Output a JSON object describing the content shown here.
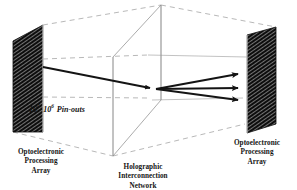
{
  "figure": {
    "background_color": "#ffffff",
    "ink_color": "#141414",
    "wireframe_color": "#8c8c8c"
  },
  "labels": {
    "left_array": {
      "line1": "Optoelectronic",
      "line2": "Processing",
      "line3": "Array"
    },
    "middle_network": {
      "line1": "Holographic",
      "line2": "Interconnection",
      "line3": "Network"
    },
    "right_array": {
      "line1": "Optoelectronic",
      "line2": "Processing",
      "line3": "Array"
    }
  },
  "annotation": {
    "pinouts": {
      "base_low": "10",
      "exponent_low": "4",
      "separator": "-",
      "base_high": "10",
      "exponent_high": "6",
      "units": "Pin-outs",
      "full_text": "10^4 - 10^6 Pin-outs"
    }
  },
  "elements": {
    "left_plane_name": "Optoelectronic Processing Array (input plane)",
    "right_plane_name": "Optoelectronic Processing Array (output plane)",
    "center_plane_name": "Holographic Interconnection Network plane",
    "beam_count_in": 1,
    "beam_count_out": 3
  }
}
